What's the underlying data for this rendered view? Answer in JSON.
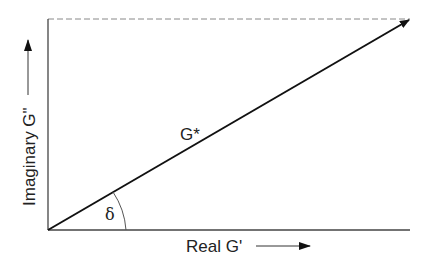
{
  "diagram": {
    "type": "complex-modulus-vector-diagram",
    "x_axis_label": "Real G'",
    "y_axis_label": "Imaginary G\"",
    "vector_label": "G*",
    "angle_label": "δ",
    "colors": {
      "line": "#111111",
      "text": "#222222",
      "dashed": "#888888",
      "background": "#ffffff"
    }
  }
}
